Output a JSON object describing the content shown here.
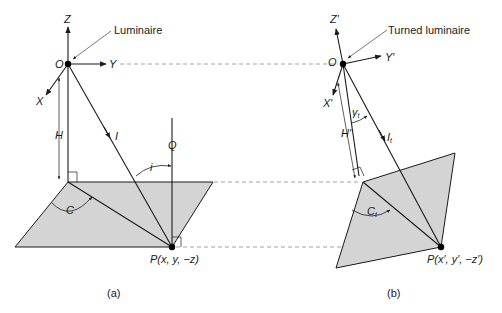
{
  "diagram_a": {
    "label": "(a)",
    "callout": "Luminaire",
    "axes": {
      "z": "Z",
      "y": "Y",
      "x": "X",
      "origin": "O"
    },
    "height_label": "H",
    "intensity_label": "I",
    "normal_label": "Q",
    "incidence_angle_label": "i",
    "azimuth_angle_label": "C",
    "point_label": "P(x, y, −z)"
  },
  "diagram_b": {
    "label": "(b)",
    "callout": "Turned luminaire",
    "axes": {
      "z": "Z′",
      "y": "Y′",
      "x": "X′",
      "origin": "O"
    },
    "height_label": "H′",
    "intensity_label": "I",
    "intensity_sub": "t",
    "gamma_label": "γ",
    "gamma_sub": "t",
    "azimuth_angle_label": "C",
    "azimuth_sub": "t",
    "point_label": "P(x′, y′, −z′)"
  },
  "colors": {
    "plane_fill": "#d4d4d4",
    "line": "#1a1a1a",
    "dashed": "#8a8a8a"
  }
}
